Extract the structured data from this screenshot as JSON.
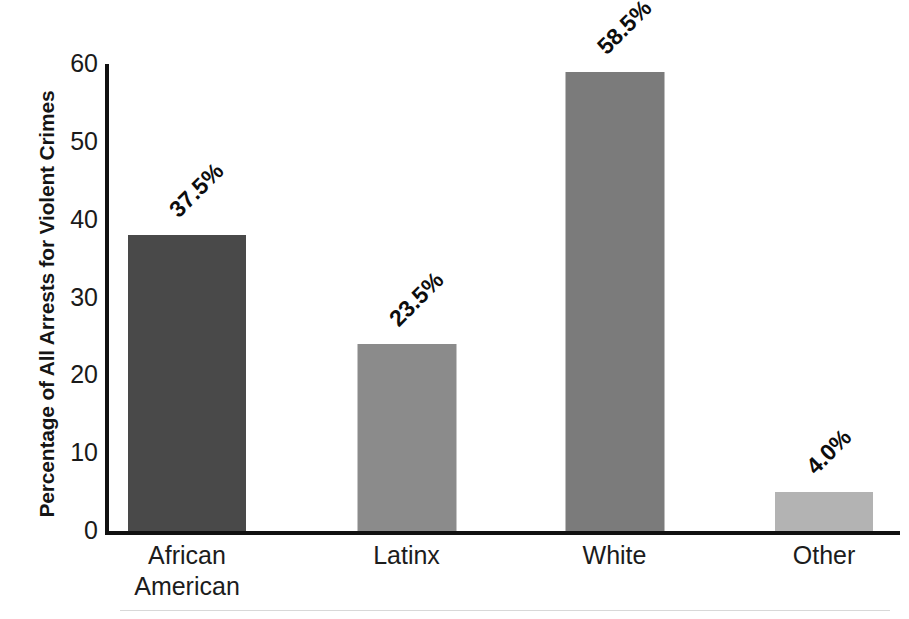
{
  "chart_data": {
    "type": "bar",
    "title": "",
    "subtitle": "",
    "xlabel": "",
    "ylabel": "Percentage of All Arrests for Violent Crimes",
    "categories": [
      "African American",
      "Latinx",
      "White",
      "Other"
    ],
    "category_lines": [
      [
        "African",
        "American"
      ],
      [
        "Latinx"
      ],
      [
        "White"
      ],
      [
        "Other"
      ]
    ],
    "values": [
      37.5,
      23.5,
      58.5,
      4.0
    ],
    "bar_heights": [
      38.0,
      24.0,
      59.0,
      5.0
    ],
    "data_labels": [
      "37.5%",
      "23.5%",
      "58.5%",
      "4.0%"
    ],
    "bar_colors": [
      "#494949",
      "#8b8b8b",
      "#7b7b7b",
      "#b3b3b3"
    ],
    "ylim": [
      0,
      60
    ],
    "yticks": [
      0,
      10,
      20,
      30,
      40,
      50,
      60
    ],
    "ytick_labels": [
      "0",
      "10",
      "20",
      "30",
      "40",
      "50",
      "60"
    ],
    "grid": false,
    "legend": false,
    "legend_position": "none",
    "data_label_rotation": 45,
    "axis_color": "#111111",
    "background_color": "#ffffff"
  }
}
